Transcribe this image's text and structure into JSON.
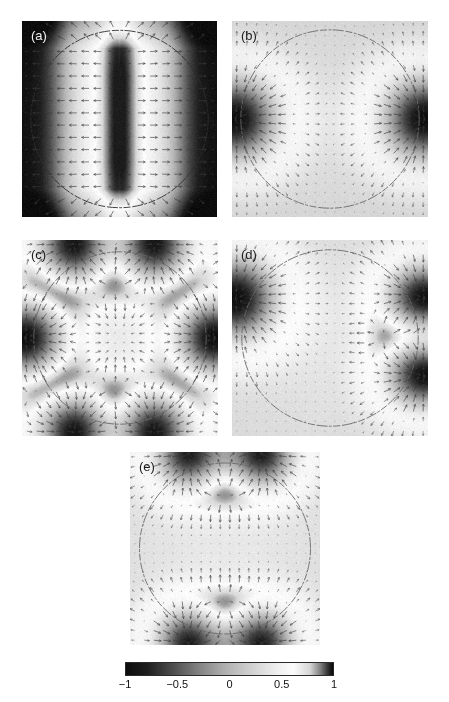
{
  "figure": {
    "type": "multi-panel-field-plot",
    "background": "#ffffff",
    "width": 449,
    "height": 702
  },
  "panels": [
    {
      "id": "a",
      "label": "(a)",
      "label_color": "#f2f2f2",
      "x": 22,
      "y": 21,
      "w": 195,
      "h": 196,
      "mode": "stripes",
      "background_value": -1.0,
      "circle": {
        "cx": 0.5,
        "cy": 0.5,
        "r": 0.455
      },
      "lobes": [],
      "quiver": {
        "nx": 16,
        "ny": 16,
        "visible": true,
        "color": "#3a3a3a"
      },
      "field_note": "Vertical bright band through the center with symmetric dark flanks; strongly negative (dark) toward left and right edges."
    },
    {
      "id": "b",
      "label": "(b)",
      "label_color": "#1c1c1c",
      "x": 232,
      "y": 21,
      "w": 196,
      "h": 196,
      "mode": "lobes",
      "background_value": 0.22,
      "circle": {
        "cx": 0.5,
        "cy": 0.5,
        "r": 0.455
      },
      "lobes": [
        {
          "cx": 0.02,
          "cy": 0.5,
          "rx": 0.17,
          "ry": 0.17,
          "amp": -1.0
        },
        {
          "cx": 0.98,
          "cy": 0.5,
          "rx": 0.17,
          "ry": 0.17,
          "amp": -1.0
        }
      ],
      "quiver": {
        "nx": 20,
        "ny": 20,
        "visible": true,
        "color": "#3a3a3a"
      },
      "field_note": "Two dark (negative) lobes centered on the left and right domain edges at mid-height; m = 1 symmetry."
    },
    {
      "id": "c",
      "label": "(c)",
      "label_color": "#1c1c1c",
      "x": 22,
      "y": 240,
      "w": 196,
      "h": 196,
      "mode": "lobes",
      "background_value": 0.3,
      "circle": {
        "cx": 0.5,
        "cy": 0.5,
        "r": 0.44
      },
      "lobes": [
        {
          "cx": 0.28,
          "cy": 0.02,
          "rx": 0.15,
          "ry": 0.15,
          "amp": -1.0
        },
        {
          "cx": 0.66,
          "cy": 0.02,
          "rx": 0.15,
          "ry": 0.15,
          "amp": -1.0
        },
        {
          "cx": 0.02,
          "cy": 0.5,
          "rx": 0.15,
          "ry": 0.15,
          "amp": -1.0
        },
        {
          "cx": 0.98,
          "cy": 0.5,
          "rx": 0.15,
          "ry": 0.15,
          "amp": -1.0
        },
        {
          "cx": 0.28,
          "cy": 0.98,
          "rx": 0.15,
          "ry": 0.15,
          "amp": -1.0
        },
        {
          "cx": 0.66,
          "cy": 0.98,
          "rx": 0.15,
          "ry": 0.15,
          "amp": -1.0
        }
      ],
      "quiver": {
        "nx": 20,
        "ny": 20,
        "visible": true,
        "color": "#3a3a3a"
      },
      "field_note": "Six dark lobes distributed around the circle: two top, two bottom, one left, one right."
    },
    {
      "id": "d",
      "label": "(d)",
      "label_color": "#1c1c1c",
      "x": 232,
      "y": 240,
      "w": 196,
      "h": 196,
      "mode": "lobes",
      "background_value": 0.28,
      "circle": {
        "cx": 0.5,
        "cy": 0.5,
        "r": 0.45
      },
      "lobes": [
        {
          "cx": 0.02,
          "cy": 0.3,
          "rx": 0.17,
          "ry": 0.17,
          "amp": -1.0
        },
        {
          "cx": 0.98,
          "cy": 0.3,
          "rx": 0.15,
          "ry": 0.14,
          "amp": -1.0
        },
        {
          "cx": 0.98,
          "cy": 0.68,
          "rx": 0.15,
          "ry": 0.14,
          "amp": -1.0
        }
      ],
      "quiver": {
        "nx": 20,
        "ny": 20,
        "visible": true,
        "color": "#3a3a3a"
      },
      "field_note": "Three dark lobes: one on the upper-left edge, two stacked on the right edge."
    },
    {
      "id": "e",
      "label": "(e)",
      "label_color": "#1c1c1c",
      "x": 130,
      "y": 452,
      "w": 190,
      "h": 193,
      "mode": "lobes",
      "background_value": 0.3,
      "circle": {
        "cx": 0.5,
        "cy": 0.5,
        "r": 0.45
      },
      "lobes": [
        {
          "cx": 0.33,
          "cy": 0.01,
          "rx": 0.15,
          "ry": 0.14,
          "amp": -1.0
        },
        {
          "cx": 0.67,
          "cy": 0.01,
          "rx": 0.15,
          "ry": 0.14,
          "amp": -1.0
        },
        {
          "cx": 0.33,
          "cy": 0.99,
          "rx": 0.15,
          "ry": 0.14,
          "amp": -1.0
        },
        {
          "cx": 0.67,
          "cy": 0.99,
          "rx": 0.15,
          "ry": 0.14,
          "amp": -1.0
        }
      ],
      "quiver": {
        "nx": 20,
        "ny": 20,
        "visible": true,
        "color": "#3a3a3a"
      },
      "field_note": "Four dark lobes: two on the top edge and two on the bottom edge."
    }
  ],
  "colorbar": {
    "orientation": "horizontal",
    "min": -1,
    "max": 1,
    "colormap": "diverging-grayscale-dark-light-dark",
    "ticks": [
      {
        "value": -1,
        "label": "−1"
      },
      {
        "value": -0.5,
        "label": "−0.5"
      },
      {
        "value": 0,
        "label": "0"
      },
      {
        "value": 0.5,
        "label": "0.5"
      },
      {
        "value": 1,
        "label": "1"
      }
    ]
  },
  "chart_data": {
    "type": "heatmap",
    "title": "",
    "xlabel": "",
    "ylabel": "",
    "colorbar_label": "",
    "clim": [
      -1,
      1
    ],
    "colorbar_ticks": [
      -1,
      -0.5,
      0,
      0.5,
      1
    ],
    "colorbar_ticklabels": [
      "−1",
      "−0.5",
      "0",
      "0.5",
      "1"
    ],
    "colormap": "diverging grayscale: dark at −1, white near +0.6, dark at +1",
    "grid": false,
    "legend": null,
    "panel_labels": [
      "(a)",
      "(b)",
      "(c)",
      "(d)",
      "(e)"
    ],
    "panels": [
      {
        "label": "(a)",
        "dark_lobe_count": 0,
        "pattern": "vertical stripe",
        "lobe_angles_deg": [],
        "background_value": -1.0,
        "peak_value": 0.95,
        "min_value": -1.0,
        "circle_radius_fraction": 0.455
      },
      {
        "label": "(b)",
        "dark_lobe_count": 2,
        "pattern": "m = 1 dipolar",
        "lobe_angles_deg": [
          0,
          180
        ],
        "background_value": 0.22,
        "peak_value": 0.45,
        "min_value": -1.0,
        "circle_radius_fraction": 0.455
      },
      {
        "label": "(c)",
        "dark_lobe_count": 6,
        "pattern": "m = 3 hexapolar",
        "lobe_angles_deg": [
          0,
          60,
          120,
          180,
          240,
          300
        ],
        "background_value": 0.3,
        "peak_value": 0.5,
        "min_value": -1.0,
        "circle_radius_fraction": 0.44
      },
      {
        "label": "(d)",
        "dark_lobe_count": 3,
        "pattern": "asymmetric tri-lobe",
        "lobe_angles_deg": [
          145,
          35,
          325
        ],
        "background_value": 0.28,
        "peak_value": 0.45,
        "min_value": -1.0,
        "circle_radius_fraction": 0.45
      },
      {
        "label": "(e)",
        "dark_lobe_count": 4,
        "pattern": "m = 2 quadrupolar",
        "lobe_angles_deg": [
          60,
          120,
          240,
          300
        ],
        "background_value": 0.3,
        "peak_value": 0.5,
        "min_value": -1.0,
        "circle_radius_fraction": 0.45
      }
    ]
  }
}
